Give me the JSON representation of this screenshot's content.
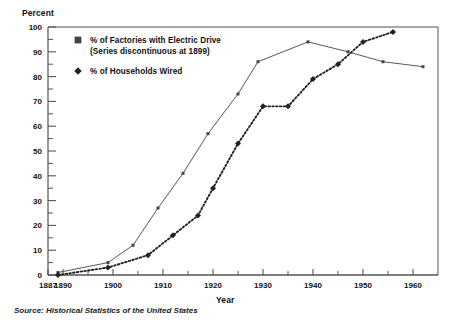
{
  "chart_data": {
    "type": "line",
    "title": "",
    "xlabel": "Year",
    "ylabel": "Percent",
    "xlim": [
      1887,
      1965
    ],
    "ylim": [
      0,
      100
    ],
    "grid": false,
    "legend_position": "top-left",
    "y_ticks": [
      0,
      10,
      20,
      30,
      40,
      50,
      60,
      70,
      80,
      90,
      100
    ],
    "y_minor_ticks": [
      5,
      15,
      25,
      35,
      45,
      55,
      65,
      75,
      85,
      95
    ],
    "x_ticks": [
      1887,
      1890,
      1900,
      1910,
      1920,
      1930,
      1940,
      1950,
      1960
    ],
    "x_minor_ticks": [
      1895,
      1905,
      1915,
      1925,
      1935,
      1945,
      1955
    ],
    "series": [
      {
        "name": "% of Factories with Electric Drive",
        "marker": "square",
        "line_style": "solid",
        "color": "#444444",
        "points": [
          {
            "x": 1889,
            "y": 1
          },
          {
            "x": 1899,
            "y": 5
          },
          {
            "x": 1904,
            "y": 12
          },
          {
            "x": 1909,
            "y": 27
          },
          {
            "x": 1914,
            "y": 41
          },
          {
            "x": 1919,
            "y": 57
          },
          {
            "x": 1925,
            "y": 73
          },
          {
            "x": 1929,
            "y": 86
          },
          {
            "x": 1939,
            "y": 94
          },
          {
            "x": 1947,
            "y": 90
          },
          {
            "x": 1954,
            "y": 86
          },
          {
            "x": 1962,
            "y": 84
          }
        ]
      },
      {
        "name": "% of Households Wired",
        "marker": "diamond",
        "line_style": "dotted",
        "color": "#222222",
        "points": [
          {
            "x": 1889,
            "y": 0
          },
          {
            "x": 1899,
            "y": 3
          },
          {
            "x": 1907,
            "y": 8
          },
          {
            "x": 1912,
            "y": 16
          },
          {
            "x": 1917,
            "y": 24
          },
          {
            "x": 1920,
            "y": 35
          },
          {
            "x": 1925,
            "y": 53
          },
          {
            "x": 1930,
            "y": 68
          },
          {
            "x": 1935,
            "y": 68
          },
          {
            "x": 1940,
            "y": 79
          },
          {
            "x": 1945,
            "y": 85
          },
          {
            "x": 1950,
            "y": 94
          },
          {
            "x": 1956,
            "y": 98
          }
        ]
      }
    ],
    "annotations": [
      "(Series discontinuous at 1899)",
      "Source: Historical Statistics of the United States"
    ]
  },
  "axes": {
    "y_title": "Percent",
    "x_title": "Year",
    "y_tick_labels": [
      "0",
      "10",
      "20",
      "30",
      "40",
      "50",
      "60",
      "70",
      "80",
      "90",
      "100"
    ],
    "x_tick_labels": [
      "1887",
      "1890",
      "1900",
      "1910",
      "1920",
      "1930",
      "1940",
      "1950",
      "1960"
    ]
  },
  "legend": {
    "entry1_label": "% of Factories with Electric Drive",
    "entry1_sublabel": "(Series discontinuous at 1899)",
    "entry2_label": "% of Households Wired",
    "marker1": "square-marker-icon",
    "marker2": "diamond-marker-icon"
  },
  "footer": {
    "source": "Source: Historical Statistics of the United States"
  },
  "colors": {
    "axis": "#555555",
    "series1": "#444444",
    "series2": "#222222",
    "text": "#111111",
    "background": "#ffffff"
  }
}
